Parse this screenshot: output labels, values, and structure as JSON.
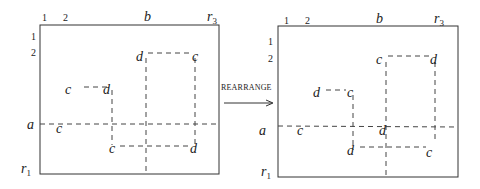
{
  "left": {
    "col_labels": [
      "1",
      "2"
    ],
    "row_labels": [
      "1",
      "2"
    ],
    "b": "b",
    "r3": "r",
    "r3_sub": "3",
    "a": "a",
    "r1": "r",
    "r1_sub": "1",
    "points": {
      "p_c_small": "c",
      "p_d_small": "d",
      "p_d_big": "d",
      "p_c_big": "c",
      "p_c_left": "c",
      "p_c_bottom": "c",
      "p_d_bottom": "d"
    }
  },
  "arrow": {
    "label": "REARRANGE"
  },
  "right": {
    "col_labels": [
      "1",
      "2"
    ],
    "row_labels": [
      "1",
      "2"
    ],
    "b": "b",
    "r3": "r",
    "r3_sub": "3",
    "a": "a",
    "r1": "r",
    "r1_sub": "1",
    "points": {
      "p_d_small": "d",
      "p_c_small": "c",
      "p_c_big": "c",
      "p_d_big": "d",
      "p_c_left": "c",
      "p_d_mid": "d",
      "p_d_bottom": "d",
      "p_c_bottom": "c"
    }
  }
}
